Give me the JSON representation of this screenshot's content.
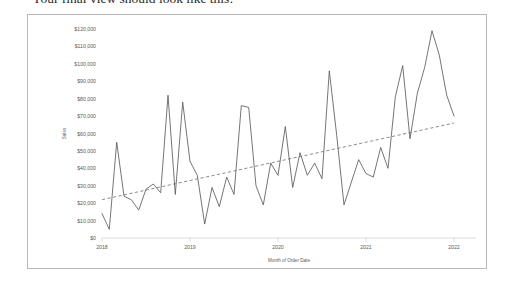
{
  "heading": {
    "text": "Your final view should look like this:"
  },
  "card": {
    "name": "chart-card",
    "border_color": "#b9b9b9",
    "background": "#ffffff"
  },
  "chart_data": {
    "type": "line",
    "title": "",
    "xlabel": "Month of Order Date",
    "ylabel": "Sales",
    "ylim": [
      0,
      120000
    ],
    "ytick_values": [
      0,
      10000,
      20000,
      30000,
      40000,
      50000,
      60000,
      70000,
      80000,
      90000,
      100000,
      110000,
      120000
    ],
    "ytick_labels": [
      "$0",
      "$10,000",
      "$20,000",
      "$30,000",
      "$40,000",
      "$50,000",
      "$60,000",
      "$70,000",
      "$80,000",
      "$90,000",
      "$100,000",
      "$110,000",
      "$120,000"
    ],
    "xtick_labels": [
      "2018",
      "2019",
      "2020",
      "2021",
      "2022"
    ],
    "xtick_values": [
      2018,
      2019,
      2020,
      2021,
      2022
    ],
    "grid": false,
    "legend": "none",
    "line_color": "#5c5c5c",
    "trend_color": "#6e6e6e",
    "trend_style": "dashed",
    "series": [
      {
        "name": "Sales",
        "x": [
          2018.0,
          2018.083,
          2018.167,
          2018.25,
          2018.333,
          2018.417,
          2018.5,
          2018.583,
          2018.667,
          2018.75,
          2018.833,
          2018.917,
          2019.0,
          2019.083,
          2019.167,
          2019.25,
          2019.333,
          2019.417,
          2019.5,
          2019.583,
          2019.667,
          2019.75,
          2019.833,
          2019.917,
          2020.0,
          2020.083,
          2020.167,
          2020.25,
          2020.333,
          2020.417,
          2020.5,
          2020.583,
          2020.667,
          2020.75,
          2020.833,
          2020.917,
          2021.0,
          2021.083,
          2021.167,
          2021.25,
          2021.333,
          2021.417,
          2021.5,
          2021.583,
          2021.667,
          2021.75,
          2021.833,
          2021.917,
          2022.0
        ],
        "values": [
          14000,
          5000,
          55000,
          24000,
          22000,
          16000,
          28000,
          31000,
          26000,
          82000,
          25000,
          78000,
          44000,
          36000,
          8000,
          29000,
          18000,
          35000,
          25000,
          76000,
          75000,
          30000,
          19000,
          43000,
          36000,
          64000,
          29000,
          49000,
          36000,
          43000,
          34000,
          96000,
          59000,
          19000,
          32000,
          45000,
          37000,
          35000,
          52000,
          40000,
          81000,
          99000,
          57000,
          83000,
          98000,
          119000,
          105000,
          82000,
          70000
        ]
      }
    ],
    "trend": {
      "name": "Trend line",
      "x_start": 2018.0,
      "x_end": 2022.0,
      "y_start": 22000,
      "y_end": 66000
    }
  }
}
